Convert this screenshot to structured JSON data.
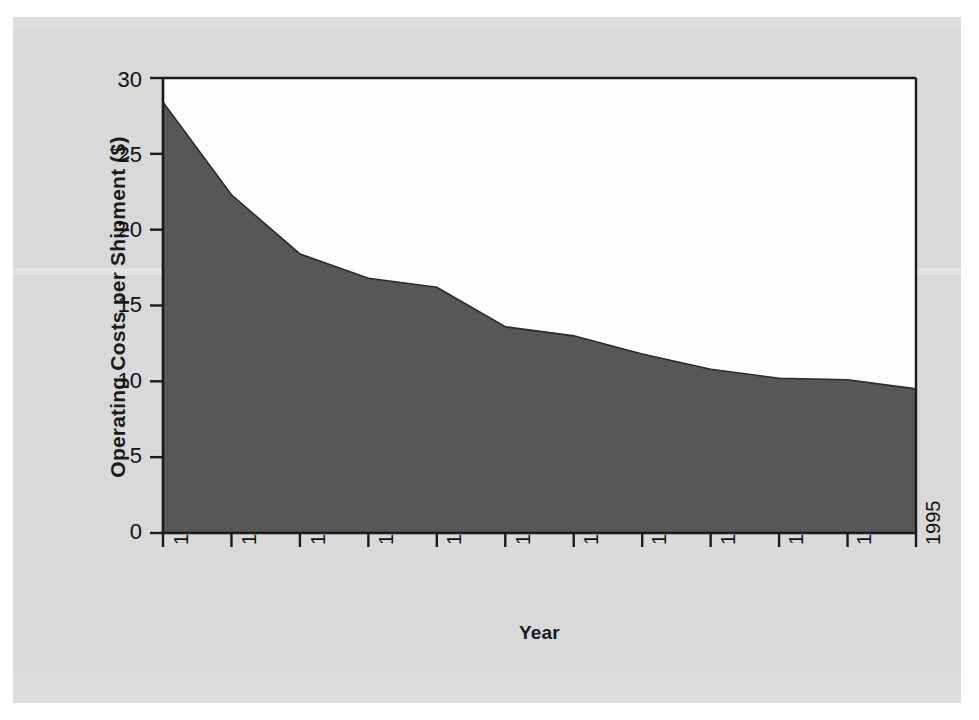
{
  "chart_data": {
    "type": "area",
    "title": "",
    "subtitle": "",
    "xlabel": "Year",
    "ylabel": "Operating Costs per Shipment ($)",
    "categories": [
      "1984",
      "1985",
      "1986",
      "1987",
      "1988",
      "1989",
      "1990",
      "1991",
      "1992",
      "1993",
      "1994",
      "1995"
    ],
    "x": [
      1984,
      1985,
      1986,
      1987,
      1988,
      1989,
      1990,
      1991,
      1992,
      1993,
      1994,
      1995
    ],
    "values": [
      28.4,
      22.3,
      18.4,
      16.8,
      16.2,
      13.6,
      13.0,
      11.8,
      10.8,
      10.2,
      10.1,
      9.5
    ],
    "series": [
      {
        "name": "Operating Costs per Shipment",
        "values": [
          28.4,
          22.3,
          18.4,
          16.8,
          16.2,
          13.6,
          13.0,
          11.8,
          10.8,
          10.2,
          10.1,
          9.5
        ]
      }
    ],
    "xlim": [
      1984,
      1995
    ],
    "ylim": [
      0,
      30
    ],
    "ytick_labels": [
      "0",
      "5",
      "10",
      "15",
      "20",
      "25",
      "30"
    ],
    "ytick_values": [
      0,
      5,
      10,
      15,
      20,
      25,
      30
    ],
    "xtick_labels": [
      "1984",
      "1985",
      "1986",
      "1987",
      "1988",
      "1989",
      "1990",
      "1991",
      "1992",
      "1993",
      "1994",
      "1995"
    ],
    "grid": false,
    "legend": "none",
    "annotations": [],
    "colors": {
      "area_fill": "#575757",
      "plot_background": "#fdfdfd",
      "axis_line": "#1a1a1a",
      "page_background": "#d9d9d9",
      "text": "#111111"
    }
  },
  "axes": {
    "y_title": "Operating Costs per Shipment ($)",
    "x_title": "Year",
    "y_ticks": [
      {
        "label": "30",
        "value": 30
      },
      {
        "label": "25",
        "value": 25
      },
      {
        "label": "20",
        "value": 20
      },
      {
        "label": "15",
        "value": 15
      },
      {
        "label": "10",
        "value": 10
      },
      {
        "label": "5",
        "value": 5
      },
      {
        "label": "0",
        "value": 0
      }
    ],
    "x_ticks": [
      {
        "label": "1984"
      },
      {
        "label": "1985"
      },
      {
        "label": "1986"
      },
      {
        "label": "1987"
      },
      {
        "label": "1988"
      },
      {
        "label": "1989"
      },
      {
        "label": "1990"
      },
      {
        "label": "1991"
      },
      {
        "label": "1992"
      },
      {
        "label": "1993"
      },
      {
        "label": "1994"
      },
      {
        "label": "1995"
      }
    ]
  }
}
